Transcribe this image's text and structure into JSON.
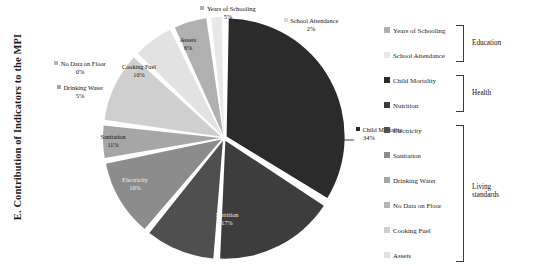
{
  "axis_title": "E. Contribution of Indicators to the MPI",
  "chart_data": {
    "type": "pie",
    "title": "E. Contribution of Indicators to the MPI",
    "xlabel": "",
    "ylabel": "E. Contribution of Indicators to the MPI",
    "legend_position": "right",
    "grid": false,
    "units": "%",
    "categories": [
      "Child Mortality",
      "Nutrition",
      "Electricity",
      "Sanitation",
      "Drinking Water",
      "No Data on Floor",
      "Cooking Fuel",
      "Assets",
      "Years of Schooling",
      "School Attendance"
    ],
    "values": [
      34,
      17,
      10,
      11,
      5,
      0,
      10,
      6,
      5,
      2
    ],
    "slices": [
      {
        "label": "Child Mortality",
        "value": 34,
        "value_text": "34%",
        "color": "#2b2b2b"
      },
      {
        "label": "Nutrition",
        "value": 17,
        "value_text": "17%",
        "color": "#3d3d3d"
      },
      {
        "label": "Electricity",
        "value": 10,
        "value_text": "10%",
        "color": "#4f4f4f"
      },
      {
        "label": "Sanitation",
        "value": 11,
        "value_text": "11%",
        "color": "#8c8c8c"
      },
      {
        "label": "Drinking Water",
        "value": 5,
        "value_text": "5%",
        "color": "#a6a6a6"
      },
      {
        "label": "No Data on Floor",
        "value": 0,
        "value_text": "0%",
        "color": "#b5b5b5"
      },
      {
        "label": "Cooking Fuel",
        "value": 10,
        "value_text": "10%",
        "color": "#cfcfcf"
      },
      {
        "label": "Assets",
        "value": 6,
        "value_text": "6%",
        "color": "#e2e2e2"
      },
      {
        "label": "Years of Schooling",
        "value": 5,
        "value_text": "5%",
        "color": "#b0b0b0"
      },
      {
        "label": "School Attendance",
        "value": 2,
        "value_text": "2%",
        "color": "#e8e8e8"
      }
    ]
  },
  "legend": {
    "items": [
      {
        "label": "Years of Schooling",
        "color": "#b0b0b0"
      },
      {
        "label": "School Attendance",
        "color": "#e8e8e8"
      },
      {
        "label": "Child Mortality",
        "color": "#2b2b2b"
      },
      {
        "label": "Nutrition",
        "color": "#3d3d3d"
      },
      {
        "label": "Electricity",
        "color": "#4f4f4f"
      },
      {
        "label": "Sanitation",
        "color": "#8c8c8c"
      },
      {
        "label": "Drinking Water",
        "color": "#a6a6a6"
      },
      {
        "label": "No Data on Floor",
        "color": "#b5b5b5"
      },
      {
        "label": "Cooking Fuel",
        "color": "#cfcfcf"
      },
      {
        "label": "Assets",
        "color": "#e2e2e2"
      }
    ],
    "groups": [
      {
        "label": "Education",
        "label_line1": "Education",
        "label_line2": ""
      },
      {
        "label": "Health",
        "label_line1": "Health",
        "label_line2": ""
      },
      {
        "label": "Living standards",
        "label_line1": "Living",
        "label_line2": "standards"
      }
    ]
  }
}
